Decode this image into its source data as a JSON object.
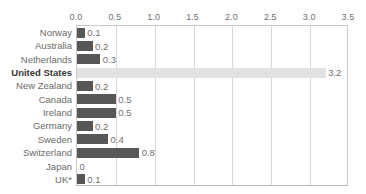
{
  "chart_data": {
    "type": "bar",
    "orientation": "horizontal",
    "title": "",
    "subtitle": "",
    "xlabel": "",
    "ylabel": "",
    "xlim": [
      0.0,
      3.5
    ],
    "xticks": [
      "0.0",
      "0.5",
      "1.0",
      "1.5",
      "2.0",
      "2.5",
      "3.0",
      "3.5"
    ],
    "xtick_values": [
      0.0,
      0.5,
      1.0,
      1.5,
      2.0,
      2.5,
      3.0,
      3.5
    ],
    "grid": "vertical",
    "legend": "none",
    "axis_position": "top",
    "categories": [
      "Norway",
      "Australia",
      "Netherlands",
      "United States",
      "New Zealand",
      "Canada",
      "Ireland",
      "Germany",
      "Sweden",
      "Switzerland",
      "Japan",
      "UK*"
    ],
    "values": [
      0.1,
      0.2,
      0.3,
      3.2,
      0.2,
      0.5,
      0.5,
      0.2,
      0.4,
      0.8,
      0.0,
      0.1
    ],
    "value_labels": [
      "0.1",
      "0.2",
      "0.3",
      "3.2",
      "0.2",
      "0.5",
      "0.5",
      "0.2",
      "0.4",
      "0.8",
      "0",
      "0.1"
    ],
    "highlight_category": "United States",
    "colors": {
      "bar": "#575757",
      "bar_highlight": "#e2e2e2",
      "gridline": "#d6d6d6",
      "axis": "#c9c9c9",
      "text": "#6a6a6a",
      "text_highlight": "#383838",
      "background": "#ffffff"
    }
  }
}
